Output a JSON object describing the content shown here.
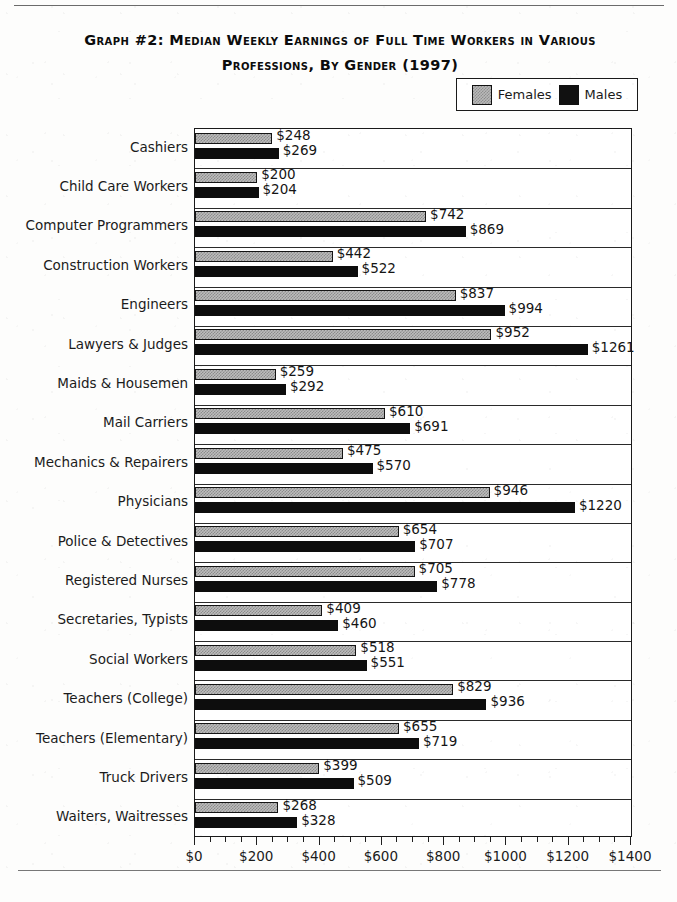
{
  "chart_data": {
    "type": "bar",
    "orientation": "horizontal",
    "title": "Graph #2: Median Weekly Earnings of Full Time Workers in Various Professions, By Gender (1997)",
    "title_line1": "Graph #2: Median Weekly Earnings of Full Time Workers in Various",
    "title_line2": "Professions, By Gender (1997)",
    "xlabel": "",
    "ylabel": "",
    "xlim": [
      0,
      1400
    ],
    "grid": false,
    "legend_position": "top-right",
    "categories": [
      "Cashiers",
      "Child Care Workers",
      "Computer Programmers",
      "Construction Workers",
      "Engineers",
      "Lawyers & Judges",
      "Maids & Housemen",
      "Mail Carriers",
      "Mechanics & Repairers",
      "Physicians",
      "Police & Detectives",
      "Registered Nurses",
      "Secretaries, Typists",
      "Social Workers",
      "Teachers (College)",
      "Teachers (Elementary)",
      "Truck Drivers",
      "Waiters, Waitresses"
    ],
    "series": [
      {
        "name": "Females",
        "color": "#bcbcbc",
        "values": [
          248,
          200,
          742,
          442,
          837,
          952,
          259,
          610,
          475,
          946,
          654,
          705,
          409,
          518,
          829,
          655,
          399,
          268
        ],
        "labels": [
          "$248",
          "$200",
          "$742",
          "$442",
          "$837",
          "$952",
          "$259",
          "$610",
          "$475",
          "$946",
          "$654",
          "$705",
          "$409",
          "$518",
          "$829",
          "$655",
          "$399",
          "$268"
        ]
      },
      {
        "name": "Males",
        "color": "#0d0d0d",
        "values": [
          269,
          204,
          869,
          522,
          994,
          1261,
          292,
          691,
          570,
          1220,
          707,
          778,
          460,
          551,
          936,
          719,
          509,
          328
        ],
        "labels": [
          "$269",
          "$204",
          "$869",
          "$522",
          "$994",
          "$1261",
          "$292",
          "$691",
          "$570",
          "$1220",
          "$707",
          "$778",
          "$460",
          "$551",
          "$936",
          "$719",
          "$509",
          "$328"
        ]
      }
    ],
    "xticks": [
      0,
      200,
      400,
      600,
      800,
      1000,
      1200,
      1400
    ],
    "xticklabels": [
      "$0",
      "$200",
      "$400",
      "$600",
      "$800",
      "$1000",
      "$1200",
      "$1400"
    ],
    "minor_tick_interval": 50
  },
  "legend": {
    "items": [
      {
        "label": "Females",
        "swatch": "hatched-gray-swatch"
      },
      {
        "label": "Males",
        "swatch": "solid-black-swatch"
      }
    ]
  }
}
